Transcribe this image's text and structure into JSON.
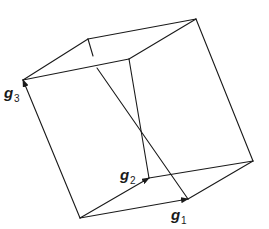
{
  "diagram": {
    "title": "",
    "labels": {
      "g1": {
        "base": "g",
        "sub": "1"
      },
      "g2": {
        "base": "g",
        "sub": "2"
      },
      "g3": {
        "base": "g",
        "sub": "3"
      }
    },
    "colors": {
      "line": "#1a1a1a",
      "background": "#ffffff"
    }
  }
}
